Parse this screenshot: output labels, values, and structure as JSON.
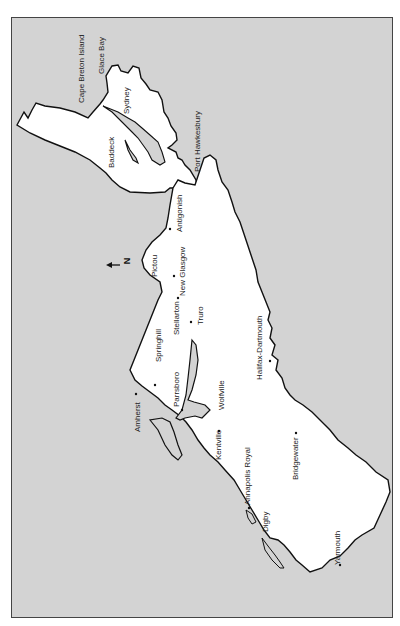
{
  "map": {
    "title": "Nova Scotia",
    "orientation": "rotated 90° counter-clockwise (north points left)",
    "colors": {
      "water": "#d3d3d3",
      "land": "#ffffff",
      "outline": "#111111",
      "frame": "#444444"
    },
    "north_arrow": {
      "label": "N",
      "direction": "left"
    },
    "places": [
      {
        "name": "Cape Breton Island",
        "x": 78,
        "y": 103
      },
      {
        "name": "Glace Bay",
        "x": 101,
        "y": 73
      },
      {
        "name": "Sydney",
        "x": 126,
        "y": 114
      },
      {
        "name": "Baddeck",
        "x": 110,
        "y": 168
      },
      {
        "name": "Port Hawkesbury",
        "x": 196,
        "y": 172
      },
      {
        "name": "Antigonish",
        "x": 178,
        "y": 232
      },
      {
        "name": "New Glasgow",
        "x": 181,
        "y": 296
      },
      {
        "name": "Pictou",
        "x": 153,
        "y": 277
      },
      {
        "name": "Stellarton",
        "x": 176,
        "y": 335
      },
      {
        "name": "Truro",
        "x": 199,
        "y": 325
      },
      {
        "name": "Springhill",
        "x": 157,
        "y": 362
      },
      {
        "name": "Parrsboro",
        "x": 176,
        "y": 407
      },
      {
        "name": "Amherst",
        "x": 138,
        "y": 432
      },
      {
        "name": "Wolfville",
        "x": 220,
        "y": 410
      },
      {
        "name": "Halifax-Dartmouth",
        "x": 258,
        "y": 380
      },
      {
        "name": "Kentville",
        "x": 217,
        "y": 460
      },
      {
        "name": "Annapolis Royal",
        "x": 246,
        "y": 505
      },
      {
        "name": "Bridgewater",
        "x": 294,
        "y": 480
      },
      {
        "name": "Digby",
        "x": 264,
        "y": 532
      },
      {
        "name": "Yarmouth",
        "x": 336,
        "y": 565
      }
    ]
  }
}
